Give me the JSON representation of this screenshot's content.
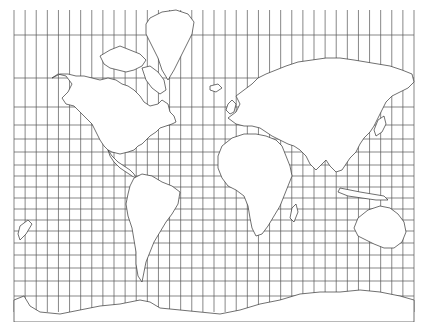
{
  "map": {
    "projection": "Mercator",
    "style": "outline",
    "graticule": {
      "meridian_interval_deg": 10,
      "meridian_count": 37,
      "parallels_visible": 19
    },
    "colors": {
      "background": "#ffffff",
      "grid": "#555555",
      "coastline": "#333333"
    },
    "landmasses": [
      "North America",
      "Greenland",
      "Canadian Arctic Archipelago",
      "South America",
      "Europe",
      "Africa",
      "Asia",
      "Australia",
      "New Zealand",
      "Antarctica",
      "Madagascar",
      "Japan",
      "Indonesia",
      "British Isles",
      "Iceland"
    ]
  }
}
